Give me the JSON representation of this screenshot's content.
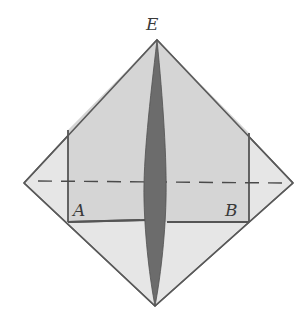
{
  "diagram": {
    "labels": {
      "top": "E",
      "left": "A",
      "right": "B"
    },
    "colors": {
      "paper_light": "#e4e4e4",
      "paper_flap": "#d6d6d6",
      "center_fold": "#6e6e6e",
      "line": "#5a5a5a",
      "background": "#ffffff"
    }
  }
}
